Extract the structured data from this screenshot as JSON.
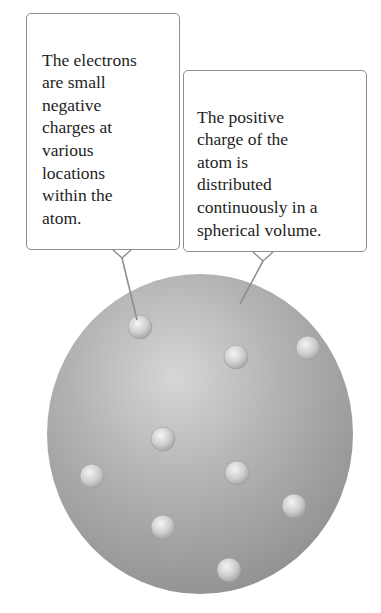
{
  "diagram": {
    "callouts": [
      {
        "id": "electrons",
        "text": "The electrons\nare small\nnegative\ncharges at\nvarious\nlocations\nwithin the\natom."
      },
      {
        "id": "positive-charge",
        "text": "The positive\ncharge of the\natom is\ndistributed\ncontinuously in a\nspherical volume."
      }
    ],
    "sphere": {
      "cx": 200,
      "cy": 434,
      "rx": 153,
      "ry": 160,
      "color_light": "#d8d8d8",
      "color_mid": "#a9a9a9",
      "color_dark": "#8a8a8a"
    },
    "electrons": [
      {
        "x": 140,
        "y": 327
      },
      {
        "x": 236,
        "y": 357
      },
      {
        "x": 308,
        "y": 348
      },
      {
        "x": 163,
        "y": 439
      },
      {
        "x": 92,
        "y": 476
      },
      {
        "x": 237,
        "y": 473
      },
      {
        "x": 294,
        "y": 506
      },
      {
        "x": 163,
        "y": 527
      },
      {
        "x": 229,
        "y": 570
      }
    ],
    "electron_radius": 12,
    "leader_color": "#8e8e8e"
  }
}
